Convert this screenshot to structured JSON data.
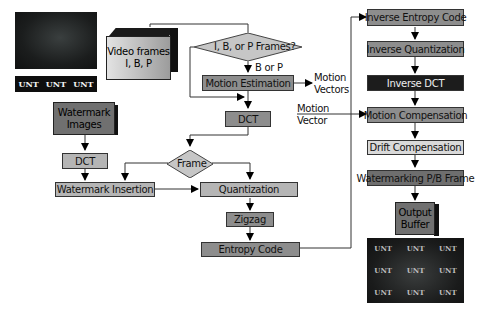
{
  "diagram": {
    "type": "flowchart"
  },
  "input_image": {
    "watermark_strip": [
      "UNT",
      "UNT",
      "UNT"
    ]
  },
  "encoder": {
    "video_frames": {
      "line1": "Video frames",
      "line2": "I, B, P"
    },
    "frame_type_decision": "I, B, or P Frames?",
    "b_or_p_label": "B or P",
    "motion_estimation": "Motion Estimation",
    "motion_vectors_label": {
      "line1": "Motion",
      "line2": "Vectors"
    },
    "dct": "DCT",
    "frame_decision": "Frame",
    "quantization": "Quantization",
    "zigzag": "Zigzag",
    "entropy_code": "Entropy Code"
  },
  "watermark": {
    "watermark_images": {
      "line1": "Watermark",
      "line2": "Images"
    },
    "dct": "DCT",
    "watermark_insertion": "Watermark Insertion"
  },
  "decoder": {
    "motion_vector_label": {
      "line1": "Motion",
      "line2": "Vector"
    },
    "inverse_entropy_code": "Inverse Entropy Code",
    "inverse_quantization": "Inverse Quantization",
    "inverse_dct": "Inverse DCT",
    "motion_compensation": "Motion Compensation",
    "drift_compensation": "Drift Compensation",
    "watermarking_pb_frame": "Watermarking P/B Frame",
    "output_buffer": {
      "line1": "Output",
      "line2": "Buffer"
    }
  },
  "output_image": {
    "watermark_grid": [
      "UNT",
      "UNT",
      "UNT",
      "UNT",
      "UNT",
      "UNT",
      "UNT",
      "UNT",
      "UNT"
    ]
  },
  "colors": {
    "box_mid": "#8d8d8d",
    "box_light": "#b5b5b5",
    "box_lighter": "#d9d9d9",
    "box_dark": "#1c1c1c",
    "line": "#333333"
  }
}
